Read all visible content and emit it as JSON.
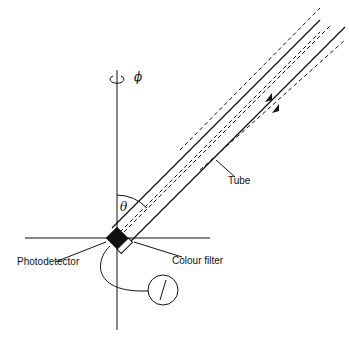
{
  "labels": {
    "tube": "Tube",
    "colour_filter": "Colour filter",
    "photodetector": "Photodetector",
    "theta": "θ",
    "phi": "ϕ"
  }
}
